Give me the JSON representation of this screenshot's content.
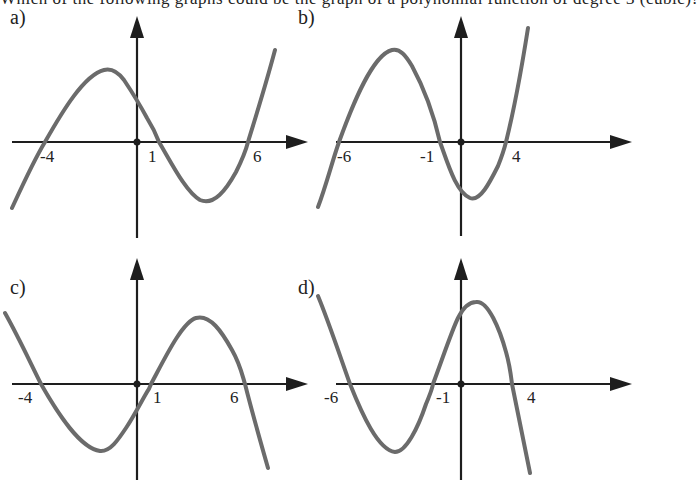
{
  "header": {
    "cut_off_text": "Which of the following graphs could be the graph of a polynomial function of degree 3 (cubic)?"
  },
  "panels": [
    {
      "label": "a)",
      "ticks": [
        "-4",
        "1",
        "6"
      ],
      "roots": [
        -4,
        1,
        6
      ],
      "leading_sign": "positive"
    },
    {
      "label": "b)",
      "ticks": [
        "-6",
        "-1",
        "4"
      ],
      "roots": [
        -6,
        -1,
        4
      ],
      "leading_sign": "positive"
    },
    {
      "label": "c)",
      "ticks": [
        "-4",
        "1",
        "6"
      ],
      "roots": [
        -4,
        1,
        6
      ],
      "leading_sign": "negative"
    },
    {
      "label": "d)",
      "ticks": [
        "-6",
        "-1",
        "4"
      ],
      "roots": [
        -6,
        -1,
        4
      ],
      "leading_sign": "negative"
    }
  ],
  "colors": {
    "axis": "#1e1e1e",
    "curve": "#6b6b6b",
    "background": "#ffffff"
  }
}
